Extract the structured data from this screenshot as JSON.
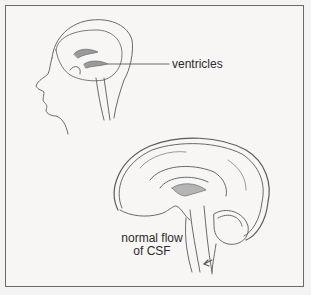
{
  "figure": {
    "labels": {
      "ventricles": "ventricles",
      "flow_line1": "normal flow",
      "flow_line2": "of CSF"
    },
    "colors": {
      "background": "#f4f3f1",
      "line": "#555555",
      "border": "#6a6a6a",
      "text": "#2b2b2b"
    }
  }
}
